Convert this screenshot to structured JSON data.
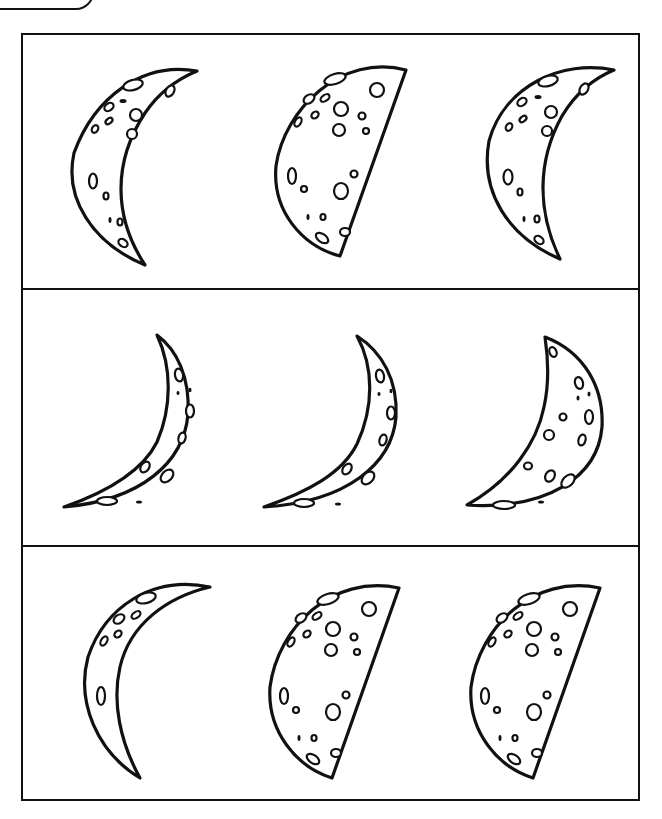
{
  "worksheet": {
    "header_tab_label": "",
    "title": "",
    "colors": {
      "ink": "#111111",
      "paper": "#ffffff"
    },
    "grid": {
      "rows": 3,
      "columns": 3
    },
    "rows": [
      {
        "cells": [
          {
            "shape": "crescent-left",
            "label": "waxing-crescent-moon"
          },
          {
            "shape": "half-left",
            "label": "half-moon"
          },
          {
            "shape": "crescent-left",
            "label": "waxing-crescent-moon"
          }
        ]
      },
      {
        "cells": [
          {
            "shape": "thin-crescent-right",
            "label": "thin-crescent-moon"
          },
          {
            "shape": "thin-crescent-right",
            "label": "thin-crescent-moon"
          },
          {
            "shape": "wide-crescent-right",
            "label": "crescent-moon"
          }
        ]
      },
      {
        "cells": [
          {
            "shape": "narrow-crescent-left",
            "label": "narrow-crescent-moon"
          },
          {
            "shape": "half-left",
            "label": "half-moon"
          },
          {
            "shape": "half-left",
            "label": "half-moon"
          }
        ]
      }
    ]
  }
}
